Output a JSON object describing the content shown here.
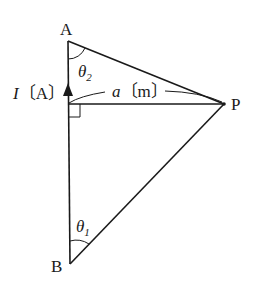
{
  "diagram": {
    "type": "geometry-physics",
    "points": {
      "A": {
        "label": "A",
        "x": 68,
        "y": 41
      },
      "B": {
        "label": "B",
        "x": 70,
        "y": 264
      },
      "P": {
        "label": "P",
        "x": 224,
        "y": 104
      },
      "foot": {
        "x": 68,
        "y": 104
      }
    },
    "labels": {
      "current_symbol": "I",
      "current_unit": "〔A〕",
      "distance_symbol": "a",
      "distance_unit": "〔m〕",
      "theta": "θ",
      "theta1_sub": "1",
      "theta2_sub": "2"
    },
    "annotations": {
      "right_angle_at_foot": true,
      "current_direction": "up (B to A)"
    },
    "colors": {
      "line": "#1a1a1a",
      "background": "#ffffff"
    }
  }
}
